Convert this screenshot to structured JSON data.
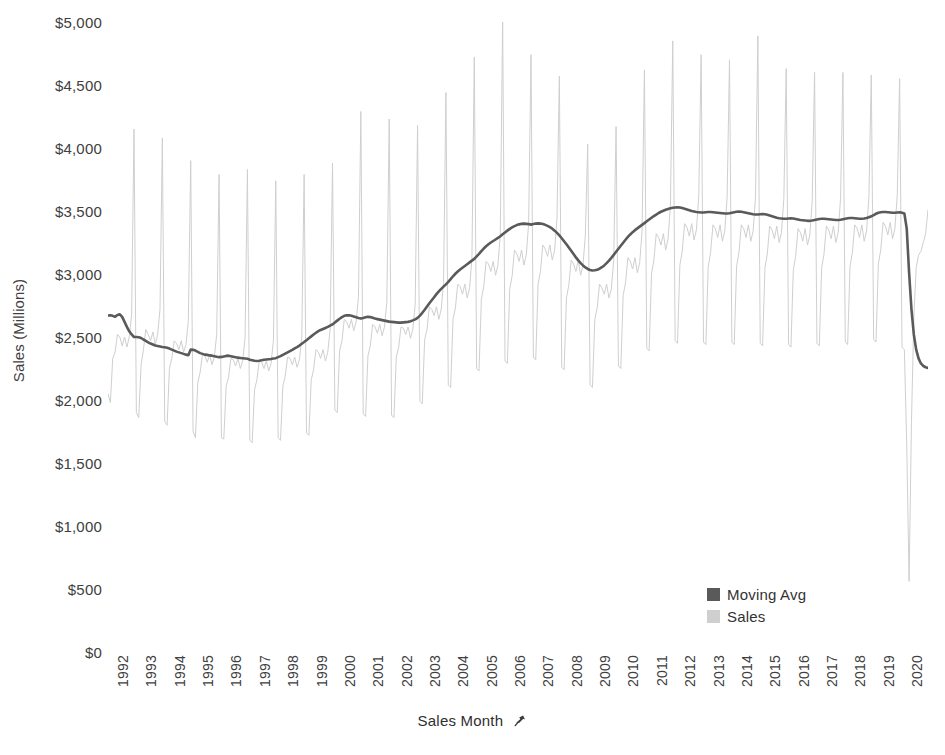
{
  "chart_data": {
    "type": "line",
    "title": "",
    "xlabel": "Sales Month",
    "ylabel": "Sales (Millions)",
    "ylim": [
      0,
      5000
    ],
    "ytick_step": 500,
    "ytick_labels": [
      "$5,000",
      "$4,500",
      "$4,000",
      "$3,500",
      "$3,000",
      "$2,500",
      "$2,000",
      "$1,500",
      "$1,000",
      "$500",
      "$0"
    ],
    "ytick_values": [
      5000,
      4500,
      4000,
      3500,
      3000,
      2500,
      2000,
      1500,
      1000,
      500,
      0
    ],
    "xtick_labels": [
      "1992",
      "1993",
      "1994",
      "1995",
      "1996",
      "1997",
      "1998",
      "1999",
      "2000",
      "2001",
      "2002",
      "2003",
      "2004",
      "2005",
      "2006",
      "2007",
      "2008",
      "2009",
      "2010",
      "2011",
      "2012",
      "2013",
      "2014",
      "2015",
      "2016",
      "2017",
      "2018",
      "2019",
      "2020"
    ],
    "x_start_year": 1992,
    "x_end_year": 2020,
    "grid": false,
    "legend_position": "inside-bottom-right",
    "xlabel_icon": "pin-icon",
    "series": [
      {
        "name": "Sales",
        "color": "#cfcfcf",
        "width": 1,
        "frequency": "monthly",
        "values": [
          2050,
          1980,
          2330,
          2380,
          2520,
          2500,
          2430,
          2500,
          2420,
          2500,
          2680,
          4150,
          1900,
          1860,
          2280,
          2400,
          2560,
          2520,
          2470,
          2540,
          2440,
          2520,
          2720,
          4080,
          1830,
          1800,
          2250,
          2330,
          2470,
          2450,
          2400,
          2470,
          2380,
          2440,
          2630,
          3900,
          1750,
          1700,
          2140,
          2220,
          2370,
          2350,
          2300,
          2360,
          2280,
          2340,
          2520,
          3790,
          1700,
          1690,
          2110,
          2180,
          2330,
          2320,
          2270,
          2330,
          2250,
          2310,
          2490,
          3830,
          1680,
          1660,
          2080,
          2160,
          2310,
          2300,
          2250,
          2310,
          2230,
          2290,
          2470,
          3740,
          1700,
          1680,
          2110,
          2190,
          2340,
          2330,
          2280,
          2340,
          2260,
          2320,
          2500,
          3790,
          1740,
          1720,
          2160,
          2240,
          2400,
          2380,
          2330,
          2400,
          2310,
          2380,
          2560,
          3880,
          1920,
          1900,
          2390,
          2470,
          2640,
          2620,
          2570,
          2640,
          2550,
          2620,
          2820,
          4290,
          1890,
          1870,
          2350,
          2430,
          2600,
          2580,
          2530,
          2600,
          2510,
          2580,
          2780,
          4230,
          1880,
          1860,
          2340,
          2420,
          2580,
          2570,
          2520,
          2580,
          2490,
          2560,
          2760,
          4180,
          1990,
          1970,
          2480,
          2560,
          2740,
          2720,
          2670,
          2740,
          2640,
          2720,
          2930,
          4440,
          2120,
          2100,
          2640,
          2730,
          2920,
          2900,
          2840,
          2920,
          2810,
          2890,
          3120,
          4720,
          2250,
          2230,
          2800,
          2900,
          3100,
          3080,
          3020,
          3100,
          2990,
          3070,
          3310,
          5030,
          2310,
          2290,
          2880,
          2980,
          3190,
          3160,
          3100,
          3190,
          3070,
          3150,
          3400,
          4740,
          2340,
          2320,
          2920,
          3020,
          3230,
          3200,
          3140,
          3230,
          3110,
          3190,
          3440,
          4570,
          2260,
          2240,
          2810,
          2910,
          3110,
          3080,
          3020,
          3110,
          2990,
          3070,
          3310,
          4030,
          2120,
          2100,
          2640,
          2730,
          2920,
          2890,
          2840,
          2920,
          2810,
          2880,
          3110,
          4170,
          2270,
          2250,
          2830,
          2930,
          3130,
          3100,
          3040,
          3130,
          3010,
          3090,
          3340,
          4620,
          2410,
          2390,
          3000,
          3110,
          3320,
          3290,
          3230,
          3320,
          3190,
          3280,
          3540,
          4850,
          2470,
          2450,
          3070,
          3180,
          3400,
          3370,
          3300,
          3400,
          3270,
          3350,
          3620,
          4740,
          2460,
          2440,
          3060,
          3170,
          3390,
          3360,
          3290,
          3390,
          3260,
          3340,
          3610,
          4700,
          2460,
          2440,
          3060,
          3170,
          3390,
          3360,
          3290,
          3390,
          3260,
          3340,
          3610,
          4890,
          2450,
          2430,
          3050,
          3160,
          3380,
          3350,
          3280,
          3380,
          3250,
          3330,
          3600,
          4630,
          2440,
          2420,
          3030,
          3140,
          3360,
          3330,
          3260,
          3360,
          3230,
          3310,
          3580,
          4600,
          2450,
          2430,
          3050,
          3160,
          3380,
          3350,
          3280,
          3380,
          3250,
          3330,
          3600,
          4600,
          2460,
          2440,
          3060,
          3170,
          3390,
          3360,
          3290,
          3390,
          3260,
          3340,
          3610,
          4580,
          2480,
          2460,
          3080,
          3190,
          3410,
          3380,
          3310,
          3410,
          3280,
          3360,
          3630,
          4550,
          2420,
          2400,
          1650,
          560,
          1820,
          2650,
          3050,
          3150,
          3180,
          3250,
          3320,
          3510
        ]
      },
      {
        "name": "Moving Avg",
        "color": "#5a5a5a",
        "width": 2.6,
        "frequency": "monthly",
        "window": 12,
        "values": [
          2670,
          2672,
          2668,
          2660,
          2675,
          2680,
          2660,
          2620,
          2580,
          2545,
          2520,
          2500,
          2500,
          2498,
          2492,
          2480,
          2470,
          2458,
          2448,
          2440,
          2432,
          2428,
          2424,
          2420,
          2418,
          2414,
          2408,
          2400,
          2392,
          2384,
          2378,
          2372,
          2366,
          2360,
          2356,
          2400,
          2398,
          2392,
          2382,
          2372,
          2366,
          2360,
          2358,
          2354,
          2352,
          2348,
          2344,
          2340,
          2342,
          2346,
          2350,
          2352,
          2348,
          2344,
          2340,
          2336,
          2334,
          2332,
          2330,
          2328,
          2320,
          2316,
          2312,
          2310,
          2312,
          2316,
          2320,
          2322,
          2324,
          2326,
          2330,
          2332,
          2340,
          2348,
          2358,
          2368,
          2378,
          2388,
          2398,
          2410,
          2420,
          2432,
          2446,
          2460,
          2475,
          2490,
          2505,
          2520,
          2534,
          2546,
          2556,
          2564,
          2572,
          2580,
          2590,
          2600,
          2615,
          2630,
          2645,
          2658,
          2668,
          2672,
          2672,
          2668,
          2662,
          2656,
          2650,
          2646,
          2650,
          2656,
          2660,
          2658,
          2652,
          2646,
          2642,
          2638,
          2634,
          2630,
          2626,
          2622,
          2620,
          2618,
          2616,
          2614,
          2614,
          2616,
          2618,
          2620,
          2625,
          2632,
          2640,
          2652,
          2670,
          2692,
          2716,
          2742,
          2768,
          2792,
          2816,
          2840,
          2862,
          2882,
          2900,
          2918,
          2938,
          2960,
          2982,
          3002,
          3020,
          3036,
          3050,
          3064,
          3078,
          3092,
          3106,
          3120,
          3140,
          3160,
          3182,
          3202,
          3220,
          3236,
          3250,
          3262,
          3274,
          3286,
          3300,
          3316,
          3330,
          3344,
          3358,
          3370,
          3380,
          3388,
          3394,
          3398,
          3400,
          3398,
          3396,
          3392,
          3396,
          3400,
          3402,
          3400,
          3396,
          3390,
          3382,
          3372,
          3360,
          3344,
          3326,
          3306,
          3284,
          3260,
          3236,
          3210,
          3184,
          3158,
          3132,
          3108,
          3086,
          3068,
          3052,
          3040,
          3032,
          3028,
          3030,
          3034,
          3042,
          3054,
          3068,
          3086,
          3106,
          3128,
          3152,
          3176,
          3200,
          3224,
          3248,
          3272,
          3294,
          3314,
          3332,
          3348,
          3362,
          3376,
          3390,
          3404,
          3418,
          3432,
          3446,
          3460,
          3472,
          3484,
          3494,
          3502,
          3510,
          3516,
          3522,
          3526,
          3528,
          3530,
          3528,
          3524,
          3518,
          3512,
          3506,
          3500,
          3496,
          3492,
          3490,
          3488,
          3488,
          3490,
          3492,
          3492,
          3490,
          3488,
          3486,
          3484,
          3482,
          3480,
          3480,
          3482,
          3486,
          3490,
          3494,
          3496,
          3494,
          3490,
          3486,
          3482,
          3478,
          3474,
          3472,
          3472,
          3474,
          3476,
          3474,
          3470,
          3464,
          3458,
          3452,
          3446,
          3442,
          3440,
          3438,
          3438,
          3440,
          3442,
          3440,
          3436,
          3432,
          3428,
          3426,
          3424,
          3422,
          3422,
          3424,
          3428,
          3432,
          3436,
          3438,
          3438,
          3436,
          3434,
          3432,
          3430,
          3428,
          3428,
          3430,
          3434,
          3438,
          3442,
          3444,
          3444,
          3442,
          3440,
          3438,
          3438,
          3440,
          3444,
          3450,
          3458,
          3468,
          3478,
          3486,
          3490,
          3492,
          3492,
          3490,
          3488,
          3486,
          3486,
          3488,
          3490,
          3486,
          3480,
          3360,
          3010,
          2720,
          2520,
          2400,
          2330,
          2290,
          2270,
          2260,
          2255
        ]
      }
    ]
  },
  "legend": {
    "items": [
      {
        "label": "Moving Avg",
        "color": "#5a5a5a"
      },
      {
        "label": "Sales",
        "color": "#cfcfcf"
      }
    ]
  }
}
